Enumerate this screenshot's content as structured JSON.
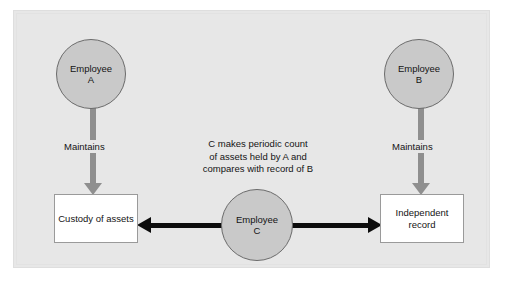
{
  "diagram": {
    "background_color": "#e7e7e7",
    "node_fill_color": "#c9c9c9",
    "node_stroke_color": "#6b6b6b",
    "box_fill_color": "#ffffff",
    "gray_arrow_color": "#8f8f8f",
    "black_arrow_color": "#0d0d0d",
    "nodes": {
      "employee_a": {
        "line1": "Employee",
        "line2": "A"
      },
      "employee_b": {
        "line1": "Employee",
        "line2": "B"
      },
      "employee_c": {
        "line1": "Employee",
        "line2": "C"
      },
      "custody_box": {
        "line1": "Custody of",
        "line2": "assets"
      },
      "record_box": {
        "line1": "Independent",
        "line2": "record"
      }
    },
    "edges": {
      "maintains_a": "Maintains",
      "maintains_b": "Maintains"
    },
    "note": {
      "line1": "C makes periodic count",
      "line2": "of assets held by A and",
      "line3": "compares with record of B"
    }
  }
}
